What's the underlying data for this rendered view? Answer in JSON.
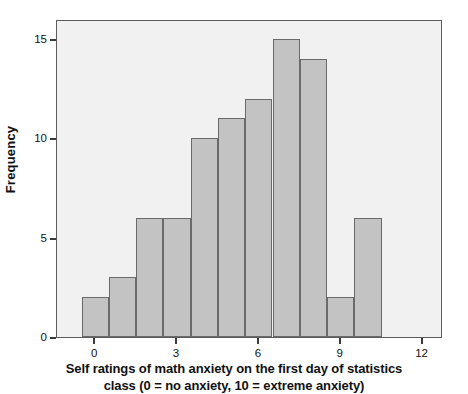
{
  "chart_data": {
    "type": "bar",
    "title": "",
    "subtitle": "",
    "xlabel_line1": "Self ratings of math anxiety on the first day of statistics",
    "xlabel_line2": "class (0 = no anxiety, 10 = extreme anxiety)",
    "ylabel": "Frequency",
    "categories": [
      0,
      1,
      2,
      3,
      4,
      5,
      6,
      7,
      8,
      9,
      10
    ],
    "values": [
      2,
      3,
      6,
      6,
      10,
      11,
      12,
      15,
      14,
      2,
      6
    ],
    "x_tick_labels": [
      "0",
      "3",
      "6",
      "9",
      "12"
    ],
    "x_tick_values": [
      0,
      3,
      6,
      9,
      12
    ],
    "y_tick_labels": [
      "0",
      "5",
      "10",
      "15"
    ],
    "y_tick_values": [
      0,
      5,
      10,
      15
    ],
    "xlim": [
      -1.4,
      12.75
    ],
    "ylim": [
      0,
      16
    ],
    "grid": false,
    "legend": "none",
    "bar_fill_color": "#c3c3c3",
    "bar_edge_color": "#6a6a6a",
    "plot_background_color": "#f1f1f1",
    "frame_color": "#5c5c5c",
    "page_background_color": "#ffffff",
    "text_color": "#111111"
  }
}
